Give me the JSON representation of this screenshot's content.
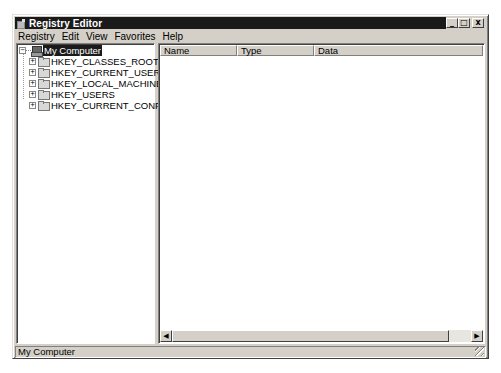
{
  "window": {
    "title": "Registry Editor",
    "icon": "registry-editor-icon",
    "controls": {
      "minimize": "_",
      "maximize": "□",
      "close": "x"
    }
  },
  "menubar": {
    "items": [
      {
        "label": "Registry"
      },
      {
        "label": "Edit"
      },
      {
        "label": "View"
      },
      {
        "label": "Favorites"
      },
      {
        "label": "Help"
      }
    ]
  },
  "tree": {
    "root": {
      "label": "My Computer",
      "expander": "−",
      "icon": "computer-icon",
      "selected": true
    },
    "children": [
      {
        "label": "HKEY_CLASSES_ROOT",
        "expander": "+",
        "icon": "folder-icon"
      },
      {
        "label": "HKEY_CURRENT_USER",
        "expander": "+",
        "icon": "folder-icon"
      },
      {
        "label": "HKEY_LOCAL_MACHINE",
        "expander": "+",
        "icon": "folder-icon"
      },
      {
        "label": "HKEY_USERS",
        "expander": "+",
        "icon": "folder-icon"
      },
      {
        "label": "HKEY_CURRENT_CONFIG",
        "expander": "+",
        "icon": "folder-icon"
      }
    ]
  },
  "list": {
    "columns": [
      {
        "label": "Name"
      },
      {
        "label": "Type"
      },
      {
        "label": "Data"
      }
    ],
    "rows": [],
    "scroll": {
      "left_arrow": "◀",
      "right_arrow": "▶"
    }
  },
  "statusbar": {
    "text": "My Computer"
  }
}
